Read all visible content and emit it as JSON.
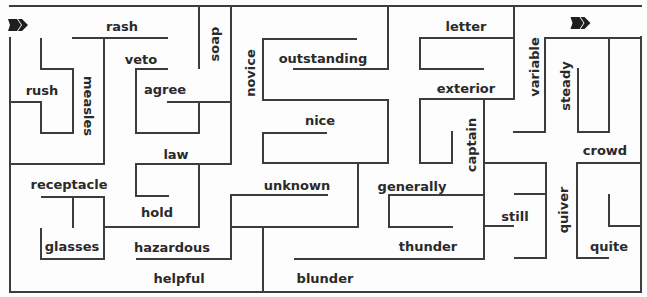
{
  "puzzle": {
    "kind": "word maze",
    "start_marker": "arrow-right",
    "end_marker": "arrow-right",
    "wall_color": "#3d3d3d",
    "text_color": "#2a2a2a"
  },
  "words": [
    {
      "text": "rash"
    },
    {
      "text": "veto"
    },
    {
      "text": "agree"
    },
    {
      "text": "rush"
    },
    {
      "text": "measles"
    },
    {
      "text": "soap"
    },
    {
      "text": "novice"
    },
    {
      "text": "outstanding"
    },
    {
      "text": "nice"
    },
    {
      "text": "letter"
    },
    {
      "text": "exterior"
    },
    {
      "text": "variable"
    },
    {
      "text": "steady"
    },
    {
      "text": "captain"
    },
    {
      "text": "crowd"
    },
    {
      "text": "generally"
    },
    {
      "text": "still"
    },
    {
      "text": "quiver"
    },
    {
      "text": "quite"
    },
    {
      "text": "thunder"
    },
    {
      "text": "blunder"
    },
    {
      "text": "unknown"
    },
    {
      "text": "law"
    },
    {
      "text": "receptacle"
    },
    {
      "text": "hold"
    },
    {
      "text": "glasses"
    },
    {
      "text": "hazardous"
    },
    {
      "text": "helpful"
    }
  ]
}
